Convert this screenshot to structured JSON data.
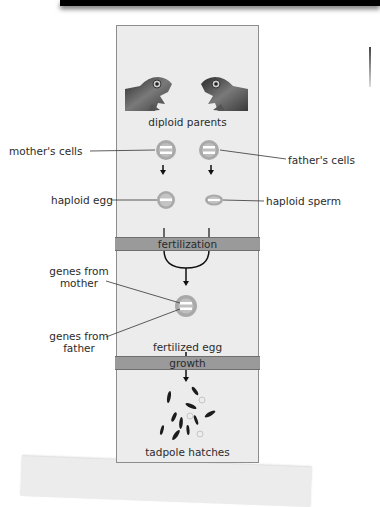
{
  "diagram": {
    "stages": {
      "parents": "diploid parents",
      "fertilization": "fertilization",
      "fertilized_egg": "fertilized egg",
      "growth": "growth",
      "offspring": "tadpole hatches"
    },
    "callouts": {
      "mother_cells": "mother's cells",
      "father_cells": "father's cells",
      "haploid_egg": "haploid egg",
      "haploid_sperm": "haploid sperm",
      "genes_from_mother": [
        "genes from",
        "mother"
      ],
      "genes_from_father": [
        "genes from",
        "father"
      ]
    },
    "icons": {
      "mother_frog": "frog-head-facing-right",
      "father_frog": "frog-head-facing-left",
      "offspring": "tadpoles"
    },
    "colors": {
      "panel": "#ececec",
      "band": "#9a9a9a",
      "cell_ring": "#a9a9a9",
      "chromosome": "#ffffff"
    }
  }
}
